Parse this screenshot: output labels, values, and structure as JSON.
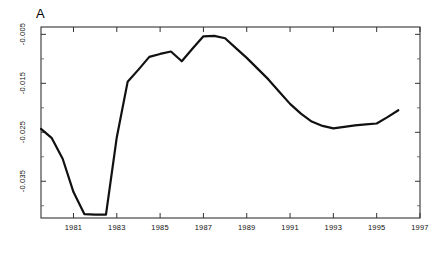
{
  "panel": {
    "label": "A"
  },
  "chart_data": {
    "type": "line",
    "title": "A",
    "xlabel": "",
    "ylabel": "",
    "xlim": [
      1979.5,
      1997.0
    ],
    "ylim": [
      -0.0425,
      -0.0035
    ],
    "grid": false,
    "legend": null,
    "xticks": [
      1981,
      1983,
      1985,
      1987,
      1989,
      1991,
      1993,
      1995,
      1997
    ],
    "xtick_labels": [
      "1981",
      "1983",
      "1985",
      "1987",
      "1989",
      "1991",
      "1993",
      "1995",
      "1997"
    ],
    "yticks": [
      -0.005,
      -0.015,
      -0.025,
      -0.035
    ],
    "ytick_labels": [
      "-0.005",
      "-0.015",
      "-0.025",
      "-0.035"
    ],
    "minor_yticks": [
      -0.01,
      -0.02,
      -0.03,
      -0.04
    ],
    "line_color": "#111111",
    "line_width": 2.2,
    "x": [
      1979.5,
      1980.0,
      1980.5,
      1981.0,
      1981.5,
      1982.0,
      1982.5,
      1983.0,
      1983.5,
      1984.0,
      1984.5,
      1985.0,
      1985.5,
      1986.0,
      1986.5,
      1987.0,
      1987.5,
      1988.0,
      1988.5,
      1989.0,
      1989.5,
      1990.0,
      1990.5,
      1991.0,
      1991.5,
      1992.0,
      1992.5,
      1993.0,
      1993.5,
      1994.0,
      1994.5,
      1995.0,
      1995.5,
      1996.0
    ],
    "y": [
      -0.0243,
      -0.0262,
      -0.0304,
      -0.0372,
      -0.0417,
      -0.0418,
      -0.0418,
      -0.026,
      -0.0147,
      -0.0122,
      -0.0096,
      -0.009,
      -0.0085,
      -0.0105,
      -0.0079,
      -0.0054,
      -0.0053,
      -0.0058,
      -0.0078,
      -0.0098,
      -0.012,
      -0.0142,
      -0.0167,
      -0.0192,
      -0.0212,
      -0.0228,
      -0.0237,
      -0.0242,
      -0.0239,
      -0.0236,
      -0.0234,
      -0.0232,
      -0.0219,
      -0.0205
    ]
  }
}
